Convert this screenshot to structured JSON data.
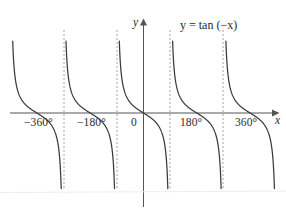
{
  "figure": {
    "title": "",
    "equation_label": "y = tan (−x)",
    "axis_labels": {
      "x": "x",
      "y": "y"
    },
    "origin_label": "0"
  },
  "colors": {
    "background": "#ffffff",
    "curve": "#3a3a3a",
    "axis": "#555555",
    "asymptote": "#9a9a9a",
    "text": "#2b2b2b"
  },
  "chart_data": {
    "type": "line",
    "title": "",
    "subtitle": "",
    "xlabel": "x",
    "ylabel": "y",
    "annotations": [
      "y = tan (−x)"
    ],
    "legend": [],
    "grid": false,
    "xlim": [
      -430,
      430
    ],
    "ylim": [
      -8,
      8
    ],
    "xtick_labels": [
      "−360°",
      "−180°",
      "0",
      "180°",
      "360°"
    ],
    "xticks": [
      -360,
      -180,
      0,
      180,
      360
    ],
    "ytick_labels": [],
    "yticks": [],
    "function": "y = tan(-x)",
    "period": 180,
    "asymptotes": [
      -270,
      -90,
      90,
      270
    ],
    "zeros": [
      -360,
      -180,
      0,
      180,
      360
    ],
    "branch_direction": "decreasing",
    "series": [
      {
        "name": "y = tan (−x)",
        "color": "#3a3a3a",
        "branches": [
          {
            "x_start": -450,
            "x_end": -270
          },
          {
            "x_start": -270,
            "x_end": -90
          },
          {
            "x_start": -90,
            "x_end": 90
          },
          {
            "x_start": 90,
            "x_end": 270
          },
          {
            "x_start": 270,
            "x_end": 450
          }
        ]
      }
    ]
  },
  "geometry": {
    "origin_px": {
      "x": 143.5,
      "y": 113
    },
    "px_per_180deg": 53.3,
    "y_scale_px_per_unit": 10.5,
    "x_axis": {
      "x_start": 10,
      "x_end": 272
    },
    "y_axis": {
      "y_top": 22,
      "y_bottom": 207
    },
    "curve_clip": {
      "top": 38,
      "bottom": 190
    },
    "asymptote_clip": {
      "top": 30,
      "bottom": 190
    }
  },
  "ticks": [
    {
      "label": "−360°",
      "left": 24,
      "top": 116
    },
    {
      "label": "−180°",
      "left": 77,
      "top": 116
    },
    {
      "label": "0",
      "left": 131,
      "top": 116
    },
    {
      "label": "180°",
      "left": 180,
      "top": 116
    },
    {
      "label": "360°",
      "left": 235,
      "top": 116
    }
  ]
}
